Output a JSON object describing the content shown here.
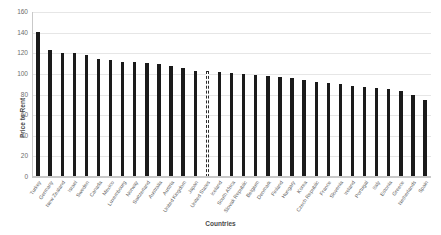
{
  "chart_data": {
    "type": "bar",
    "title": "",
    "xlabel": "Countries",
    "ylabel": "Price to Rent",
    "ylim": [
      0,
      160
    ],
    "ytick_step": 20,
    "yticks": [
      0,
      20,
      40,
      60,
      80,
      100,
      120,
      140,
      160
    ],
    "grid": true,
    "legend": "none",
    "bar_color": "#1a1a1a",
    "highlight_color": "#ffffff",
    "highlight_border": "#2b2b2b",
    "highlighted_category": "United States",
    "categories": [
      "Turkey",
      "Germany",
      "New Zealand",
      "Israel",
      "Sweden",
      "Canada",
      "Mexico",
      "Luxembourg",
      "Norway",
      "Switzerland",
      "Australia",
      "Austria",
      "United Kingdom",
      "Japan",
      "United States",
      "Iceland",
      "South Africa",
      "Slovak Republic",
      "Belgium",
      "Denmark",
      "Finland",
      "Hungary",
      "Korea",
      "Czech Republic",
      "France",
      "Slovenia",
      "Ireland",
      "Portugal",
      "Italy",
      "Estonia",
      "Greece",
      "Netherlands",
      "Spain"
    ],
    "values": [
      141,
      123,
      120,
      120,
      118,
      114,
      113,
      112,
      112,
      111,
      110,
      108,
      106,
      103,
      103,
      102,
      101,
      100,
      99,
      98,
      97,
      96,
      94,
      92,
      91,
      90,
      88,
      87,
      86,
      85,
      83,
      80,
      75
    ]
  }
}
